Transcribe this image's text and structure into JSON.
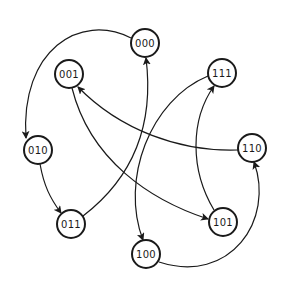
{
  "diagram": {
    "type": "state-transition-graph",
    "node_radius": 14,
    "stroke_color": "#1a1a1a",
    "background": "#ffffff",
    "nodes": [
      {
        "id": "000",
        "label": "000",
        "x": 145,
        "y": 43
      },
      {
        "id": "001",
        "label": "001",
        "x": 69,
        "y": 74
      },
      {
        "id": "111",
        "label": "111",
        "x": 222,
        "y": 73
      },
      {
        "id": "010",
        "label": "010",
        "x": 38,
        "y": 150
      },
      {
        "id": "110",
        "label": "110",
        "x": 252,
        "y": 148
      },
      {
        "id": "011",
        "label": "011",
        "x": 71,
        "y": 224
      },
      {
        "id": "101",
        "label": "101",
        "x": 223,
        "y": 222
      },
      {
        "id": "100",
        "label": "100",
        "x": 146,
        "y": 254
      }
    ],
    "edges": [
      {
        "from": "000",
        "to": "010",
        "path": "M 131 38 C 80 12, 20 50, 26 138"
      },
      {
        "from": "010",
        "to": "011",
        "path": "M 40 164 C 44 186, 50 198, 61 213"
      },
      {
        "from": "011",
        "to": "000",
        "path": "M 83 216 C 130 180, 155 130, 146 58"
      },
      {
        "from": "001",
        "to": "101",
        "path": "M 72 88 C 90 160, 150 200, 208 219"
      },
      {
        "from": "110",
        "to": "001",
        "path": "M 238 150 C 180 152, 120 130, 78 87"
      },
      {
        "from": "101",
        "to": "111",
        "path": "M 214 210 C 190 170, 190 120, 214 86"
      },
      {
        "from": "111",
        "to": "100",
        "path": "M 208 76 C 150 100, 120 180, 143 240"
      },
      {
        "from": "100",
        "to": "110",
        "path": "M 159 262 C 230 285, 275 220, 254 162"
      }
    ]
  }
}
